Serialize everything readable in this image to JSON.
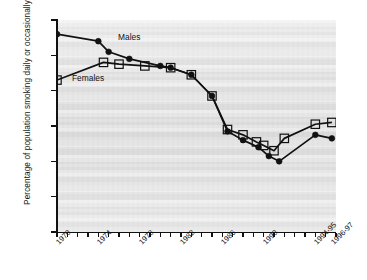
{
  "chart_data": {
    "type": "line",
    "title": "",
    "subtitle": "",
    "xlabel": "",
    "ylabel": "Percentage of population smoking daily or occasionally",
    "ylim": [
      0,
      60
    ],
    "yticks": [
      0,
      10,
      20,
      30,
      40,
      50,
      60
    ],
    "ytick_labels": [
      "0",
      "10",
      "20",
      "30",
      "40",
      "50",
      "60"
    ],
    "xlim": [
      1970,
      1997
    ],
    "xtick_labels": [
      "1970",
      "1974",
      "1978",
      "1982",
      "1986",
      "1990",
      "1994-95",
      "1996-97"
    ],
    "xtick_positions": [
      1970,
      1974,
      1978,
      1982,
      1986,
      1990,
      1995,
      1996.6
    ],
    "grid": false,
    "legend_position": "inline-annotations",
    "annotations": [
      {
        "text": "Males",
        "x": 1975.6,
        "y": 53.5
      },
      {
        "text": "Females",
        "x": 1971.6,
        "y": 41.5
      }
    ],
    "series": [
      {
        "name": "Males",
        "marker": "filled-circle",
        "color": "#111111",
        "points": [
          {
            "x": 1970.0,
            "y": 56.0
          },
          {
            "x": 1974.0,
            "y": 54.0
          },
          {
            "x": 1975.0,
            "y": 51.0
          },
          {
            "x": 1977.0,
            "y": 49.0
          },
          {
            "x": 1980.0,
            "y": 47.0
          },
          {
            "x": 1981.0,
            "y": 46.5
          },
          {
            "x": 1983.0,
            "y": 44.5
          },
          {
            "x": 1985.0,
            "y": 38.5
          },
          {
            "x": 1986.5,
            "y": 28.5
          },
          {
            "x": 1988.0,
            "y": 26.0
          },
          {
            "x": 1989.5,
            "y": 24.0
          },
          {
            "x": 1990.5,
            "y": 21.5
          },
          {
            "x": 1991.5,
            "y": 20.0
          },
          {
            "x": 1995.0,
            "y": 27.5
          },
          {
            "x": 1996.6,
            "y": 26.5
          }
        ]
      },
      {
        "name": "Females",
        "marker": "open-square",
        "color": "#111111",
        "points": [
          {
            "x": 1970.0,
            "y": 43.0
          },
          {
            "x": 1974.5,
            "y": 48.0
          },
          {
            "x": 1976.0,
            "y": 47.5
          },
          {
            "x": 1978.5,
            "y": 47.0
          },
          {
            "x": 1981.0,
            "y": 46.5
          },
          {
            "x": 1983.0,
            "y": 44.5
          },
          {
            "x": 1985.0,
            "y": 38.5
          },
          {
            "x": 1986.5,
            "y": 29.0
          },
          {
            "x": 1988.0,
            "y": 27.5
          },
          {
            "x": 1989.3,
            "y": 25.5
          },
          {
            "x": 1990.0,
            "y": 24.5
          },
          {
            "x": 1991.0,
            "y": 23.0
          },
          {
            "x": 1992.0,
            "y": 26.5
          },
          {
            "x": 1995.0,
            "y": 30.5
          },
          {
            "x": 1996.6,
            "y": 31.0
          }
        ]
      }
    ]
  },
  "axes": {
    "y_title": "Percentage of population smoking daily or occasionally"
  }
}
